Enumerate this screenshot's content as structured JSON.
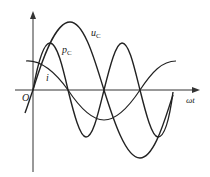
{
  "diagram": {
    "type": "waveform",
    "labels": {
      "origin": "O",
      "x_axis": "ωt",
      "u_c": "u",
      "u_c_sub": "C",
      "p_c": "p",
      "p_c_sub": "C",
      "i": "i"
    },
    "curves": [
      {
        "name": "u_C",
        "shape": "sine",
        "note": "voltage, starts at zero"
      },
      {
        "name": "i",
        "shape": "cosine",
        "note": "current leads voltage by 90°"
      },
      {
        "name": "p_C",
        "shape": "double-frequency sine",
        "note": "instantaneous power"
      }
    ],
    "colors": {
      "stroke": "#222222",
      "background": "#ffffff"
    }
  }
}
